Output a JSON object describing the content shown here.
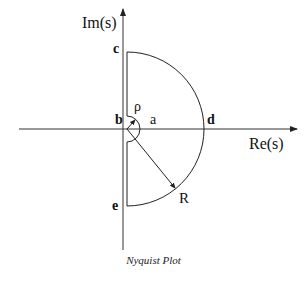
{
  "diagram": {
    "title": "Nyquist Plot",
    "axes": {
      "x_label": "Re(s)",
      "y_label": "Im(s)"
    },
    "points": {
      "a": "a",
      "b": "b",
      "c": "c",
      "d": "d",
      "e": "e"
    },
    "radii": {
      "small": "ρ",
      "large": "R"
    },
    "colors": {
      "line": "#222222",
      "background": "#ffffff"
    }
  }
}
